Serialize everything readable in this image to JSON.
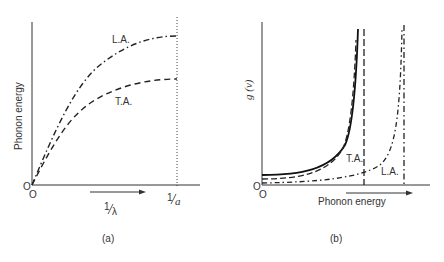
{
  "panel_a": {
    "caption": "(a)",
    "y_axis_label": "Phonon energy",
    "x_axis_label_num": "1",
    "x_axis_label_den": "λ",
    "x_tick_label_num": "1",
    "x_tick_label_den": "a",
    "origin_y": "O",
    "origin_x": "O",
    "curves": [
      {
        "name": "L.A.",
        "style": "dash-dot"
      },
      {
        "name": "T.A.",
        "style": "dashed"
      }
    ]
  },
  "panel_b": {
    "caption": "(b)",
    "y_axis_label": "g (ν)",
    "x_axis_label": "Phonon energy",
    "origin_y": "O",
    "origin_x": "O",
    "curves": [
      {
        "name": "T.A.",
        "style": "dashed"
      },
      {
        "name": "L.A.",
        "style": "dash-dot"
      },
      {
        "name": "total",
        "style": "solid"
      }
    ]
  },
  "colors": {
    "ink": "#2a2a2a",
    "background": "#ffffff"
  }
}
